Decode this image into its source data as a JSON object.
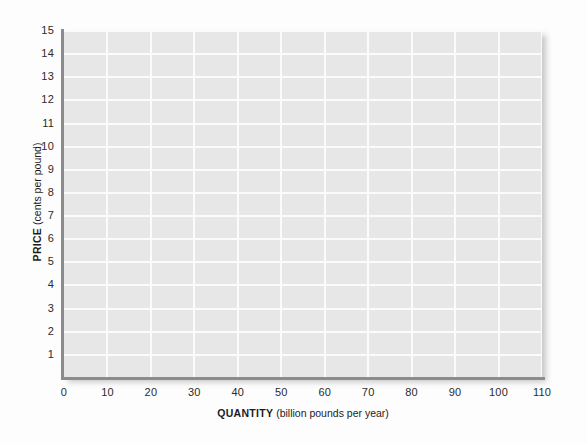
{
  "chart_data": {
    "type": "line",
    "title": "",
    "subtitle": "",
    "xlabel_bold": "QUANTITY",
    "xlabel_unit": "(billion pounds per year)",
    "ylabel_bold": "PRICE",
    "ylabel_unit": "(cents per pound)",
    "xlim": [
      0,
      110
    ],
    "ylim": [
      0,
      15
    ],
    "x_ticks": [
      0,
      10,
      20,
      30,
      40,
      50,
      60,
      70,
      80,
      90,
      100,
      110
    ],
    "x_tick_labels": [
      "0",
      "10",
      "20",
      "30",
      "40",
      "50",
      "60",
      "70",
      "80",
      "90",
      "100",
      "110"
    ],
    "y_ticks": [
      1,
      2,
      3,
      4,
      5,
      6,
      7,
      8,
      9,
      10,
      11,
      12,
      13,
      14,
      15
    ],
    "y_tick_labels": [
      "1",
      "2",
      "3",
      "4",
      "5",
      "6",
      "7",
      "8",
      "9",
      "10",
      "11",
      "12",
      "13",
      "14",
      "15"
    ],
    "grid": true,
    "grid_color": "#fbfbfb",
    "plot_background": "#e7e7e7",
    "axis_color": "#8c8c8c",
    "legend": null,
    "legend_position": "none",
    "series": [],
    "values": [],
    "categories": [],
    "annotations": []
  },
  "figure": {
    "page_background": "#fdfdfd",
    "width": 587,
    "height": 443
  }
}
